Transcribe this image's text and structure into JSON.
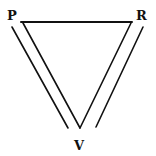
{
  "diagram": {
    "type": "inverted-triangle-with-parallel-sides",
    "labels": {
      "top_left": "P",
      "top_right": "R",
      "bottom": "V"
    },
    "edges": [
      {
        "from": "P",
        "to": "R",
        "name": "top-edge"
      },
      {
        "from": "P",
        "to": "V",
        "name": "left-edge"
      },
      {
        "from": "R",
        "to": "V",
        "name": "right-edge"
      }
    ],
    "parallel_lines": [
      {
        "parallel_to": "left-edge",
        "side": "outer"
      },
      {
        "parallel_to": "right-edge",
        "side": "outer"
      }
    ],
    "colors": {
      "stroke": "#111111",
      "background": "#ffffff"
    }
  }
}
